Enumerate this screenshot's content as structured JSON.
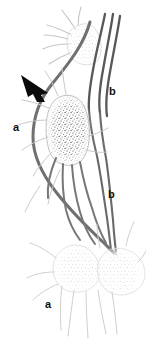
{
  "figure": {
    "background_color": "#ffffff",
    "width": 146,
    "height": 342
  },
  "labels": [
    {
      "id": "a-upper",
      "text": "a",
      "x": 13,
      "y": 122,
      "meaning": "afferent-lymphatic-vessel-upper"
    },
    {
      "id": "b-upper",
      "text": "b",
      "x": 109,
      "y": 86,
      "meaning": "efferent-lymphatic-vessel-upper"
    },
    {
      "id": "b-lower",
      "text": "b",
      "x": 108,
      "y": 189,
      "meaning": "efferent-lymphatic-vessel-lower"
    },
    {
      "id": "a-lower",
      "text": "a",
      "x": 45,
      "y": 299,
      "meaning": "afferent-lymphatic-vessel-lower"
    }
  ],
  "annotation": {
    "arrowhead": {
      "name": "black-arrowhead-pointer",
      "x": 22,
      "y": 76,
      "direction": "down-right",
      "color": "#0a0a0a"
    }
  },
  "structures": {
    "nodes": [
      {
        "name": "lymph-node-top",
        "style": "faint-stipple",
        "cx": 85,
        "cy": 44,
        "rx": 18,
        "ry": 22,
        "color": "#d8d8d8"
      },
      {
        "name": "lymph-node-middle",
        "style": "dense-stipple",
        "cx": 69,
        "cy": 130,
        "rx": 22,
        "ry": 36,
        "color": "#9a9a9a"
      },
      {
        "name": "lymph-node-bottom-left",
        "style": "faint-stipple",
        "cx": 78,
        "cy": 268,
        "rx": 24,
        "ry": 24,
        "color": "#dcdcdc"
      },
      {
        "name": "lymph-node-bottom-right",
        "style": "faint-stipple",
        "cx": 118,
        "cy": 272,
        "rx": 23,
        "ry": 24,
        "color": "#dcdcdc"
      }
    ],
    "vessels": {
      "dark_color": "#5a5a5a",
      "mid_color": "#808080",
      "light_color": "#c4c4c4",
      "dark_count": 5,
      "light_count": 14
    }
  }
}
